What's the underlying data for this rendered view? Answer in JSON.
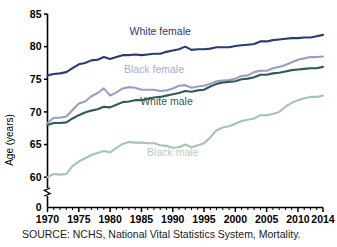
{
  "chart_data": {
    "type": "line",
    "title": "",
    "subtitle": "",
    "xlabel": "",
    "ylabel": "Age (years)",
    "xlim": [
      1970,
      2014
    ],
    "ylim": [
      59,
      85
    ],
    "grid": false,
    "legend_position": "inline-annotations",
    "y_axis_break": true,
    "y_axis_break_note": "axis broken between 0 and ~59",
    "yticks": [
      0,
      60,
      65,
      70,
      75,
      80,
      85
    ],
    "ytick_labels": [
      "0",
      "60",
      "65",
      "70",
      "75",
      "80",
      "85"
    ],
    "xticks": [
      1970,
      1975,
      1980,
      1985,
      1990,
      1995,
      2000,
      2005,
      2010,
      2014
    ],
    "xtick_labels": [
      "1970",
      "1975",
      "1980",
      "1985",
      "1990",
      "1995",
      "2000",
      "2005",
      "2010",
      "2014"
    ],
    "x": [
      1970,
      1971,
      1972,
      1973,
      1974,
      1975,
      1976,
      1977,
      1978,
      1979,
      1980,
      1981,
      1982,
      1983,
      1984,
      1985,
      1986,
      1987,
      1988,
      1989,
      1990,
      1991,
      1992,
      1993,
      1994,
      1995,
      1996,
      1997,
      1998,
      1999,
      2000,
      2001,
      2002,
      2003,
      2004,
      2005,
      2006,
      2007,
      2008,
      2009,
      2010,
      2011,
      2012,
      2013,
      2014
    ],
    "series": [
      {
        "name": "White female",
        "color": "#2b3a73",
        "label_color": "#2b3a73",
        "values": [
          75.6,
          75.8,
          75.9,
          76.1,
          76.7,
          77.3,
          77.5,
          77.9,
          78.0,
          78.4,
          78.1,
          78.4,
          78.7,
          78.7,
          78.8,
          78.7,
          78.8,
          78.9,
          78.9,
          79.2,
          79.4,
          79.6,
          80.0,
          79.5,
          79.6,
          79.6,
          79.7,
          79.9,
          79.9,
          79.9,
          80.1,
          80.2,
          80.3,
          80.4,
          80.8,
          80.8,
          81.0,
          81.1,
          81.2,
          81.3,
          81.3,
          81.4,
          81.4,
          81.6,
          81.8
        ]
      },
      {
        "name": "Black female",
        "color": "#9a9ec2",
        "label_color": "#a9adcc",
        "values": [
          68.3,
          69.1,
          69.1,
          69.3,
          70.3,
          71.3,
          71.6,
          72.4,
          72.9,
          73.6,
          72.5,
          73.0,
          73.6,
          73.8,
          73.7,
          73.4,
          73.4,
          73.4,
          73.2,
          73.3,
          73.6,
          74.0,
          74.1,
          73.7,
          73.9,
          74.0,
          74.3,
          74.7,
          74.8,
          74.9,
          75.1,
          75.5,
          75.6,
          76.1,
          76.3,
          76.3,
          76.7,
          76.9,
          77.2,
          77.6,
          78.0,
          78.2,
          78.4,
          78.4,
          78.5
        ]
      },
      {
        "name": "White male",
        "color": "#2d5c52",
        "label_color": "#2d5c52",
        "values": [
          68.0,
          68.3,
          68.3,
          68.4,
          69.0,
          69.5,
          69.9,
          70.2,
          70.4,
          70.8,
          70.7,
          71.1,
          71.5,
          71.6,
          71.8,
          71.8,
          72.0,
          72.2,
          72.3,
          72.5,
          72.7,
          72.9,
          73.2,
          73.1,
          73.3,
          73.4,
          73.9,
          74.3,
          74.5,
          74.6,
          74.7,
          75.0,
          75.1,
          75.3,
          75.7,
          75.7,
          75.9,
          76.0,
          76.2,
          76.4,
          76.5,
          76.6,
          76.7,
          76.7,
          76.9
        ]
      },
      {
        "name": "Black male",
        "color": "#a6c3b6",
        "label_color": "#b5cfc4",
        "values": [
          60.0,
          60.5,
          60.4,
          60.5,
          61.7,
          62.4,
          62.9,
          63.4,
          63.7,
          64.0,
          63.8,
          64.5,
          65.1,
          65.4,
          65.3,
          65.3,
          65.2,
          65.2,
          64.9,
          64.8,
          64.5,
          64.6,
          65.0,
          64.6,
          64.9,
          65.2,
          66.1,
          67.2,
          67.6,
          67.8,
          68.2,
          68.6,
          68.8,
          69.0,
          69.5,
          69.5,
          69.7,
          70.0,
          70.8,
          71.4,
          71.8,
          72.1,
          72.3,
          72.3,
          72.5
        ]
      }
    ],
    "annotations": [
      {
        "text": "White female",
        "x": 1988,
        "y": 81.8
      },
      {
        "text": "Black female",
        "x": 1987,
        "y": 76.0
      },
      {
        "text": "White male",
        "x": 1989,
        "y": 71.0
      },
      {
        "text": "Black male",
        "x": 1990,
        "y": 63.2
      }
    ]
  },
  "footer": {
    "source": "SOURCE: NCHS, National Vital Statistics System, Mortality."
  }
}
